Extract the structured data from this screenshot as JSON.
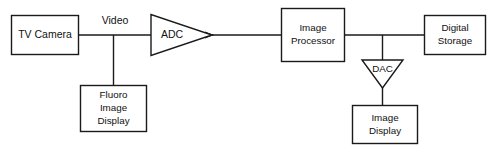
{
  "diagram": {
    "colors": {
      "stroke": "#1a1a1a",
      "fill": "#ffffff",
      "text": "#111111",
      "background": "#ffffff"
    },
    "nodes": [
      {
        "id": "tv-camera",
        "shape": "rectangle",
        "lines": [
          "TV Camera"
        ]
      },
      {
        "id": "adc",
        "shape": "triangle-right",
        "lines": [
          "ADC"
        ]
      },
      {
        "id": "fluoro-image-display",
        "shape": "rectangle",
        "lines": [
          "Fluoro",
          "Image",
          "Display"
        ]
      },
      {
        "id": "image-processor",
        "shape": "rectangle",
        "lines": [
          "Image",
          "Processor"
        ]
      },
      {
        "id": "dac",
        "shape": "triangle-down",
        "lines": [
          "DAC"
        ]
      },
      {
        "id": "digital-storage",
        "shape": "rectangle",
        "lines": [
          "Digital",
          "Storage"
        ]
      },
      {
        "id": "image-display",
        "shape": "rectangle",
        "lines": [
          "Image",
          "Display"
        ]
      }
    ],
    "connector_labels": [
      {
        "id": "video",
        "text": "Video"
      }
    ]
  }
}
